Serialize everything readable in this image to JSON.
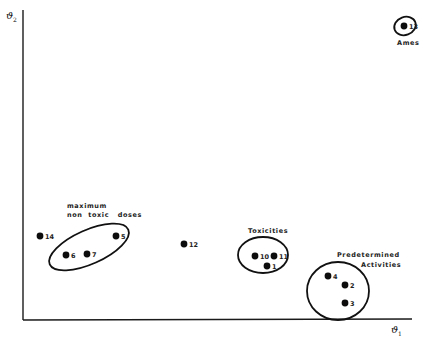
{
  "figure": {
    "x_axis_label": "ϑ",
    "x_axis_subscript": "1",
    "y_axis_label": "ϑ",
    "y_axis_subscript": "2"
  },
  "groups": [
    {
      "id": "ames",
      "label_lines": [
        "Ames"
      ],
      "members": [
        "13"
      ]
    },
    {
      "id": "max-non-toxic",
      "label_lines": [
        "maximum",
        "non  toxic   doses"
      ],
      "members": [
        "5",
        "6",
        "7"
      ]
    },
    {
      "id": "toxicities",
      "label_lines": [
        "Toxicities"
      ],
      "members": [
        "10",
        "11",
        "1"
      ]
    },
    {
      "id": "predetermined",
      "label_lines": [
        "Predetermined",
        "Activities"
      ],
      "members": [
        "4",
        "2",
        "3"
      ]
    }
  ],
  "points": [
    {
      "id": "13",
      "label": "13",
      "x": 404,
      "y": 26
    },
    {
      "id": "14",
      "label": "14",
      "x": 40,
      "y": 236
    },
    {
      "id": "5",
      "label": "5",
      "x": 116,
      "y": 236
    },
    {
      "id": "6",
      "label": "6",
      "x": 66,
      "y": 255
    },
    {
      "id": "7",
      "label": "7",
      "x": 87,
      "y": 254
    },
    {
      "id": "12",
      "label": "12",
      "x": 184,
      "y": 244
    },
    {
      "id": "10",
      "label": "10",
      "x": 255,
      "y": 256
    },
    {
      "id": "11",
      "label": "11",
      "x": 274,
      "y": 256
    },
    {
      "id": "1",
      "label": "1",
      "x": 267,
      "y": 266
    },
    {
      "id": "4",
      "label": "4",
      "x": 328,
      "y": 276
    },
    {
      "id": "2",
      "label": "2",
      "x": 345,
      "y": 285
    },
    {
      "id": "3",
      "label": "3",
      "x": 345,
      "y": 303
    }
  ]
}
